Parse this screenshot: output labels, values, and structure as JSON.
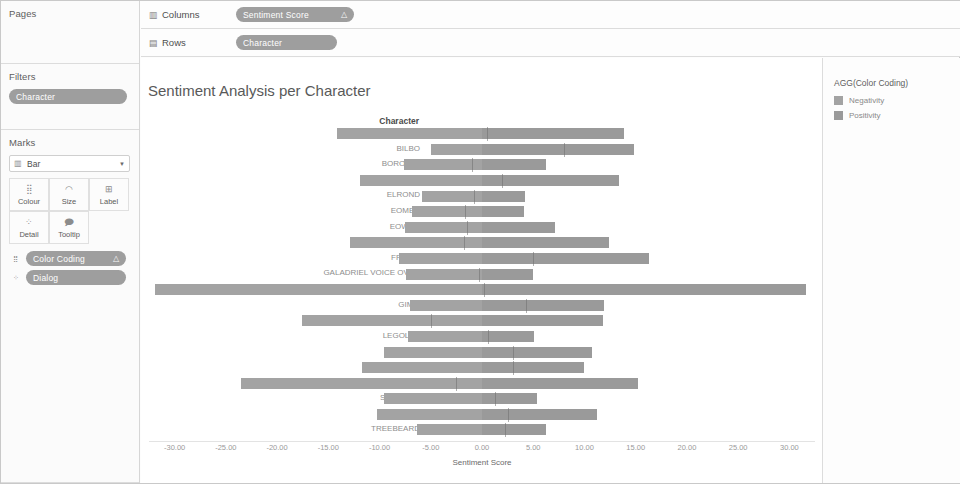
{
  "sidebar": {
    "pages": {
      "title": "Pages"
    },
    "filters": {
      "title": "Filters",
      "pills": [
        {
          "label": "Character",
          "icon": ""
        }
      ]
    },
    "marks": {
      "title": "Marks",
      "type_label": "Bar",
      "type_icon": "bar-icon",
      "caret_icon": "▼",
      "buttons": [
        {
          "name": "colour",
          "label": "Colour",
          "glyph": "⣿"
        },
        {
          "name": "size",
          "label": "Size",
          "glyph": "◠"
        },
        {
          "name": "label",
          "label": "Label",
          "glyph": "⊞"
        },
        {
          "name": "detail",
          "label": "Detail",
          "glyph": "⁘"
        },
        {
          "name": "tooltip",
          "label": "Tooltip",
          "glyph": "🗩"
        }
      ],
      "pills": [
        {
          "label": "Color Coding",
          "icon": "△",
          "glyph": "⣿"
        },
        {
          "label": "Dialog",
          "icon": "",
          "glyph": "⁘"
        }
      ]
    }
  },
  "shelves": {
    "columns": {
      "name": "Columns",
      "icon": "▥",
      "pill": {
        "label": "Sentiment Score",
        "icon": "△"
      }
    },
    "rows": {
      "name": "Rows",
      "icon": "▤",
      "pill": {
        "label": "Character",
        "icon": ""
      }
    }
  },
  "viz": {
    "title": "Sentiment Analysis per Character",
    "row_header": "Character"
  },
  "legend": {
    "title": "AGG(Color Coding)",
    "items": [
      {
        "label": "Negativity",
        "color": "#a3a3a3"
      },
      {
        "label": "Positivity",
        "color": "#9a9a9a"
      }
    ]
  },
  "colors": {
    "negativity": "#a3a3a3",
    "positivity": "#9a9a9a",
    "pill": "#9e9e9e",
    "zero_line": "#6f6f6f"
  },
  "chart_data": {
    "type": "bar",
    "title": "Sentiment Analysis per Character",
    "xlabel": "Sentiment Score",
    "ylabel": "Character",
    "orientation": "horizontal",
    "stacked": "diverging",
    "xlim": [
      -32.5,
      32.5
    ],
    "xticks": [
      -30,
      -25,
      -20,
      -15,
      -10,
      -5,
      0,
      5,
      10,
      15,
      20,
      25,
      30
    ],
    "xticklabels": [
      "-30.00",
      "-25.00",
      "-20.00",
      "-15.00",
      "-10.00",
      "-5.00",
      "0.00",
      "5.00",
      "10.00",
      "15.00",
      "20.00",
      "25.00",
      "30.00"
    ],
    "grid": false,
    "legend_position": "right",
    "categories": [
      "ARAGORN",
      "BILBO",
      "BOROMIR",
      "DENETHOR",
      "ELROND",
      "EOMER",
      "EOWYN",
      "FARAMIR",
      "FRODO",
      "GALADRIEL VOICE OVER",
      "GANDALF",
      "GIMLI",
      "GOLLUM",
      "LEGOLAS",
      "MERRY",
      "PIPPIN",
      "SAM",
      "SARUMAN",
      "THEODEN",
      "TREEBEARD"
    ],
    "series": [
      {
        "name": "Negativity",
        "color": "#a3a3a3",
        "values": [
          -14.2,
          -5.0,
          -7.6,
          -11.9,
          -5.9,
          -6.8,
          -7.5,
          -12.9,
          -8.1,
          -7.4,
          -31.9,
          -7.0,
          -17.6,
          -7.2,
          -9.6,
          -11.7,
          -23.5,
          -9.6,
          -10.2,
          -6.3
        ]
      },
      {
        "name": "Positivity",
        "color": "#9a9a9a",
        "values": [
          13.9,
          14.8,
          6.2,
          13.4,
          4.2,
          4.1,
          7.1,
          12.4,
          16.3,
          5.0,
          31.6,
          11.9,
          11.8,
          5.1,
          10.7,
          10.0,
          15.2,
          5.4,
          11.2,
          6.2
        ]
      }
    ],
    "zero_marker_offsets": [
      0.5,
      8.0,
      -1.0,
      2.0,
      -0.8,
      -1.7,
      -1.5,
      -1.8,
      5.0,
      -0.3,
      0.2,
      4.3,
      -5.0,
      0.6,
      3.0,
      3.0,
      -2.5,
      1.3,
      2.5,
      2.2
    ]
  }
}
